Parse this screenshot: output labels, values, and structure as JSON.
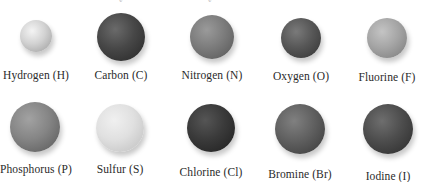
{
  "figure": {
    "caption_partial": [
      "y",
      "y"
    ],
    "atoms": [
      {
        "name": "Hydrogen (H)",
        "element": "Hydrogen",
        "symbol": "H",
        "cx": 36,
        "cy": 36,
        "r": 16,
        "label_x": 36,
        "label_y": 69,
        "color_light": "#f4f4f4",
        "color_mid": "#d2d2d2",
        "color_dark": "#9a9a9a"
      },
      {
        "name": "Carbon (C)",
        "element": "Carbon",
        "symbol": "C",
        "cx": 121,
        "cy": 37,
        "r": 24,
        "label_x": 121,
        "label_y": 69,
        "color_light": "#6a6a6a",
        "color_mid": "#474747",
        "color_dark": "#262626"
      },
      {
        "name": "Nitrogen (N)",
        "element": "Nitrogen",
        "symbol": "N",
        "cx": 212,
        "cy": 37,
        "r": 22,
        "label_x": 212,
        "label_y": 69,
        "color_light": "#9a9a9a",
        "color_mid": "#7c7c7c",
        "color_dark": "#555555"
      },
      {
        "name": "Oxygen (O)",
        "element": "Oxygen",
        "symbol": "O",
        "cx": 301,
        "cy": 38,
        "r": 20,
        "label_x": 301,
        "label_y": 70,
        "color_light": "#7a7a7a",
        "color_mid": "#575757",
        "color_dark": "#323232"
      },
      {
        "name": "Fluorine (F)",
        "element": "Fluorine",
        "symbol": "F",
        "cx": 387,
        "cy": 38,
        "r": 20,
        "label_x": 387,
        "label_y": 71,
        "color_light": "#c4c4c4",
        "color_mid": "#a5a5a5",
        "color_dark": "#7a7a7a"
      },
      {
        "name": "Phosphorus (P)",
        "element": "Phosphorus",
        "symbol": "P",
        "cx": 35,
        "cy": 127,
        "r": 25,
        "label_x": 36,
        "label_y": 163,
        "color_light": "#a2a2a2",
        "color_mid": "#858585",
        "color_dark": "#575757"
      },
      {
        "name": "Sulfur (S)",
        "element": "Sulfur",
        "symbol": "S",
        "cx": 120,
        "cy": 128,
        "r": 24,
        "label_x": 120,
        "label_y": 163,
        "color_light": "#f0f0f0",
        "color_mid": "#e0e0e0",
        "color_dark": "#bdbdbd"
      },
      {
        "name": "Chlorine (Cl)",
        "element": "Chlorine",
        "symbol": "Cl",
        "cx": 211,
        "cy": 128,
        "r": 24,
        "label_x": 211,
        "label_y": 166,
        "color_light": "#555555",
        "color_mid": "#3a3a3a",
        "color_dark": "#1e1e1e"
      },
      {
        "name": "Bromine (Br)",
        "element": "Bromine",
        "symbol": "Br",
        "cx": 300,
        "cy": 129,
        "r": 25,
        "label_x": 300,
        "label_y": 168,
        "color_light": "#808080",
        "color_mid": "#606060",
        "color_dark": "#383838"
      },
      {
        "name": "Iodine (I)",
        "element": "Iodine",
        "symbol": "I",
        "cx": 388,
        "cy": 129,
        "r": 25,
        "label_x": 388,
        "label_y": 170,
        "color_light": "#6e6e6e",
        "color_mid": "#4d4d4d",
        "color_dark": "#2a2a2a"
      }
    ]
  }
}
